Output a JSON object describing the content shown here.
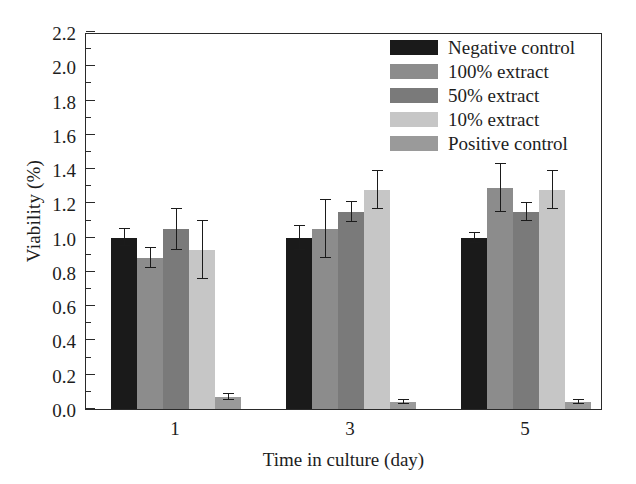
{
  "chart_data": {
    "type": "bar",
    "title": "",
    "subtitle": "",
    "xlabel": "Time in culture (day)",
    "ylabel": "Viability (%)",
    "categories": [
      "1",
      "3",
      "5"
    ],
    "ylim": [
      0.0,
      2.2
    ],
    "ytick_step": 0.2,
    "yticks": [
      "0.0",
      "0.2",
      "0.4",
      "0.6",
      "0.8",
      "1.0",
      "1.2",
      "1.4",
      "1.6",
      "1.8",
      "2.0",
      "2.2"
    ],
    "minor_ticks": true,
    "minor_tick_step": 0.1,
    "grid": false,
    "legend_position": "top-right",
    "error_bars": "symmetric",
    "series": [
      {
        "name": "Negative control",
        "color": "#1a1a1a",
        "values": [
          1.0,
          1.0,
          1.0
        ],
        "errors": [
          0.05,
          0.07,
          0.03
        ]
      },
      {
        "name": "100% extract",
        "color": "#8c8c8c",
        "values": [
          0.88,
          1.05,
          1.29
        ],
        "errors": [
          0.06,
          0.17,
          0.14
        ]
      },
      {
        "name": "50% extract",
        "color": "#7a7a7a",
        "values": [
          1.05,
          1.15,
          1.15
        ],
        "errors": [
          0.12,
          0.06,
          0.05
        ]
      },
      {
        "name": "10% extract",
        "color": "#c6c6c6",
        "values": [
          0.93,
          1.28,
          1.28
        ],
        "errors": [
          0.17,
          0.11,
          0.11
        ]
      },
      {
        "name": "Positive control",
        "color": "#9a9a9a",
        "values": [
          0.07,
          0.04,
          0.04
        ],
        "errors": [
          0.02,
          0.01,
          0.01
        ]
      }
    ]
  },
  "legend": {
    "items": [
      {
        "label": "Negative control",
        "swatch": "#1a1a1a"
      },
      {
        "label": "100% extract",
        "swatch": "#8c8c8c"
      },
      {
        "label": "50% extract",
        "swatch": "#7a7a7a"
      },
      {
        "label": "10% extract",
        "swatch": "#c6c6c6"
      },
      {
        "label": "Positive control",
        "swatch": "#9a9a9a"
      }
    ]
  }
}
